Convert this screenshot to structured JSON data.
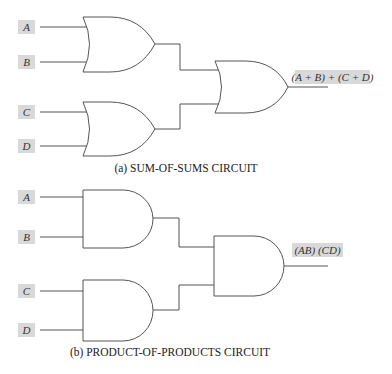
{
  "diagram": {
    "sum_of_sums": {
      "inputs": [
        "A",
        "B",
        "C",
        "D"
      ],
      "output_label": "(A + B) + (C + D)",
      "caption": "(a)  SUM-OF-SUMS CIRCUIT",
      "gate_type": "OR"
    },
    "product_of_products": {
      "inputs": [
        "A",
        "B",
        "C",
        "D"
      ],
      "output_label": "(AB) (CD)",
      "caption": "(b)  PRODUCT-OF-PRODUCTS CIRCUIT",
      "gate_type": "AND"
    }
  }
}
